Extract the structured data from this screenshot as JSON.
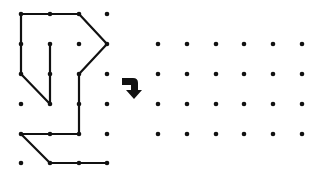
{
  "colors": {
    "ink": "#111111",
    "background": "#ffffff"
  },
  "left_grid": {
    "xs": [
      21,
      50,
      79,
      107
    ],
    "ys": [
      14,
      44,
      74,
      104,
      134,
      163
    ],
    "dot_radius": 2.3
  },
  "right_grid": {
    "xs": [
      158,
      187,
      216,
      244,
      273,
      302
    ],
    "ys": [
      44,
      74,
      104,
      134
    ],
    "dot_radius": 2.3
  },
  "figure": {
    "paths": [
      [
        [
          0,
          0
        ],
        [
          1,
          0
        ],
        [
          2,
          0
        ],
        [
          3,
          1
        ],
        [
          2,
          2
        ],
        [
          2,
          3
        ],
        [
          2,
          4
        ],
        [
          1,
          4
        ],
        [
          0,
          4
        ],
        [
          1,
          5
        ],
        [
          2,
          5
        ],
        [
          3,
          5
        ]
      ],
      [
        [
          0,
          0
        ],
        [
          0,
          1
        ],
        [
          0,
          2
        ],
        [
          1,
          3
        ],
        [
          1,
          2
        ],
        [
          1,
          1
        ]
      ]
    ],
    "stroke_width": 2.2
  },
  "arrow": {
    "icon": "bent-down-arrow-icon",
    "x": 122,
    "y": 78
  }
}
